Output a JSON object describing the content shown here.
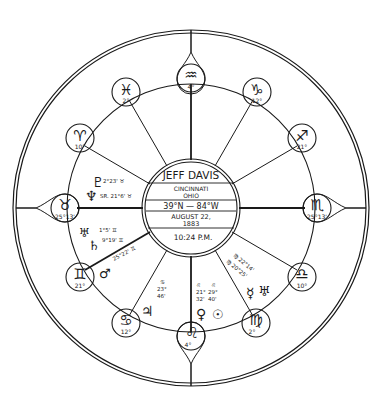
{
  "chart": {
    "subject_name": "JEFF DAVIS",
    "place_line1": "CINCINNATI",
    "place_line2": "OHIO",
    "coordinates": "39°N  —  84°W",
    "date_line1": "AUGUST 22,",
    "date_line2": "1883",
    "time": "10:24 P.M."
  },
  "colors": {
    "ink": "#1a1a1a",
    "paper": "#ffffff"
  },
  "signs": [
    {
      "name": "aquarius",
      "glyph": "♒",
      "degree": "4°"
    },
    {
      "name": "capricorn",
      "glyph": "♑",
      "degree": "12°"
    },
    {
      "name": "sagittarius",
      "glyph": "♐",
      "degree": "21°"
    },
    {
      "name": "scorpio",
      "glyph": "♏",
      "degree": "25°13'"
    },
    {
      "name": "libra",
      "glyph": "♎",
      "degree": "10°"
    },
    {
      "name": "virgo",
      "glyph": "♍",
      "degree": "2°"
    },
    {
      "name": "leo",
      "glyph": "♌",
      "degree": "4°"
    },
    {
      "name": "cancer",
      "glyph": "♋",
      "degree": "12°"
    },
    {
      "name": "gemini",
      "glyph": "♊",
      "degree": "21°"
    },
    {
      "name": "taurus",
      "glyph": "♉",
      "degree": "25°13'"
    },
    {
      "name": "aries",
      "glyph": "♈",
      "degree": "10°"
    },
    {
      "name": "pisces",
      "glyph": "♓",
      "degree": "2°"
    }
  ],
  "planets": {
    "pluto": {
      "glyph": "♇",
      "position": "2°23' ♉"
    },
    "neptune": {
      "glyph": "♆",
      "position": "SR. 21°6' ♉"
    },
    "uranus_g": {
      "glyph": "♅",
      "position": "1°5' ♊"
    },
    "saturn": {
      "glyph": "♄",
      "position": "9°19' ♊"
    },
    "mars": {
      "glyph": "♂",
      "position": "25°22' ♊"
    },
    "jupiter": {
      "glyph": "♃",
      "position_sign": "♋",
      "position_deg": "23°",
      "position_min": "46'"
    },
    "venus": {
      "glyph": "♀",
      "position_sign": "♌",
      "position_deg": "21°",
      "position_min": "32'"
    },
    "sun": {
      "glyph": "☉",
      "position_sign": "♌",
      "position_deg": "29°",
      "position_min": "40'"
    },
    "mercury": {
      "glyph": "☿",
      "position": "♍ 22°14'"
    },
    "uranus": {
      "glyph": "♅",
      "position": "♍ 20°25'"
    }
  }
}
